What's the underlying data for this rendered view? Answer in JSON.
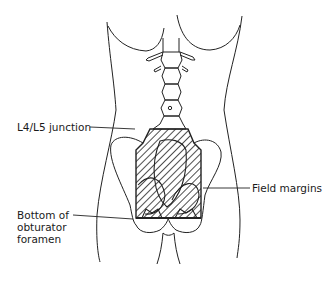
{
  "figure": {
    "labels": {
      "l4l5": "L4/L5 junction",
      "field_margins": "Field margins",
      "obturator_line1": "Bottom of",
      "obturator_line2": "obturator",
      "obturator_line3": "foramen"
    },
    "colors": {
      "line": "#222222",
      "background": "#ffffff"
    }
  }
}
